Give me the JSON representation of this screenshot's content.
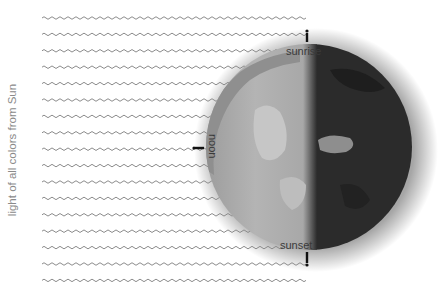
{
  "diagram": {
    "side_label": "light of all colors from Sun",
    "labels": {
      "sunrise": "sunrise",
      "noon": "noon",
      "sunset": "sunset"
    },
    "wave_rows": 17,
    "colors": {
      "wave": "#8c8c8c",
      "day_side": "#a9a9a9",
      "night_side": "#2b2b2b",
      "label_dark": "#3a3a3a",
      "label_light": "#d8d8d8",
      "side_label": "#8a8a8a"
    },
    "markers": [
      "observer-sunrise",
      "observer-noon",
      "observer-sunset"
    ]
  }
}
